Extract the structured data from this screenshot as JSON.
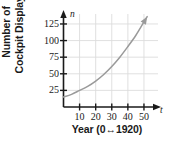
{
  "chart_data": {
    "type": "line",
    "title": "",
    "xlabel": "Year (0↔1920)",
    "ylabel": "Number of Cockpit Displays",
    "x_axis_symbol": "t",
    "y_axis_symbol": "n",
    "xlim": [
      0,
      55
    ],
    "ylim": [
      0,
      140
    ],
    "xticks": [
      10,
      20,
      30,
      40,
      50
    ],
    "yticks": [
      25,
      50,
      75,
      100,
      125
    ],
    "xtick_labels": [
      "10",
      "20",
      "30",
      "40",
      "50"
    ],
    "ytick_labels": [
      "25",
      "50",
      "75",
      "100",
      "125"
    ],
    "grid": true,
    "legend": false,
    "curve_color": "#9a9a9a",
    "axis_color": "#1a1a1a",
    "grid_color": "#dcdcdc",
    "series": [
      {
        "name": "Cockpit displays",
        "x": [
          0,
          5,
          10,
          15,
          20,
          25,
          30,
          35,
          40,
          45,
          50,
          52
        ],
        "values": [
          15,
          19,
          25,
          31,
          39,
          49,
          61,
          75,
          91,
          108,
          128,
          136
        ]
      }
    ]
  },
  "ylabel_lines": {
    "line1": "Number of",
    "line2": "Cockpit Displays"
  }
}
